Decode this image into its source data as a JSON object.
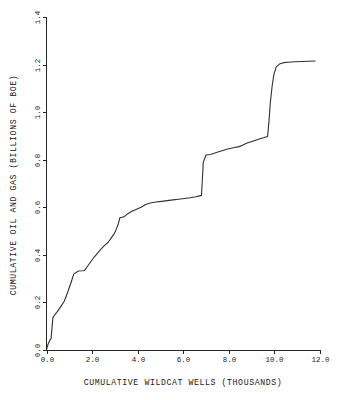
{
  "chart_data": {
    "type": "line",
    "title": "",
    "xlabel": "CUMULATIVE WILDCAT WELLS (THOUSANDS)",
    "ylabel": "CUMULATIVE OIL AND GAS (BILLIONS OF BOE)",
    "xlim": [
      0.0,
      12.0
    ],
    "ylim": [
      0.0,
      1.4
    ],
    "grid": false,
    "legend": null,
    "xticks": [
      "0.0",
      "2.0",
      "4.0",
      "6.0",
      "8.0",
      "10.0",
      "12.0"
    ],
    "xtick_values": [
      0.0,
      2.0,
      4.0,
      6.0,
      8.0,
      10.0,
      12.0
    ],
    "yticks": [
      "0.0",
      "0.2",
      "0.4",
      "0.6",
      "0.8",
      "1.0",
      "1.2",
      "1.4"
    ],
    "ytick_values": [
      0.0,
      0.2,
      0.4,
      0.6,
      0.8,
      1.0,
      1.2,
      1.4
    ],
    "series": [
      {
        "name": "cumulative discovery",
        "color": "#303030",
        "x": [
          0.0,
          0.03,
          0.06,
          0.1,
          0.14,
          0.2,
          0.28,
          0.36,
          0.45,
          0.6,
          0.78,
          0.95,
          1.08,
          1.2,
          1.4,
          1.58,
          1.66,
          1.8,
          1.95,
          2.1,
          2.25,
          2.4,
          2.55,
          2.7,
          2.82,
          2.95,
          3.05,
          3.15,
          3.22,
          3.4,
          3.55,
          3.75,
          3.95,
          4.15,
          4.35,
          4.55,
          4.8,
          5.05,
          5.3,
          5.55,
          5.8,
          6.05,
          6.3,
          6.55,
          6.72,
          6.8,
          6.84,
          6.88,
          7.0,
          7.2,
          7.45,
          7.7,
          7.95,
          8.2,
          8.45,
          8.62,
          8.8,
          9.05,
          9.3,
          9.55,
          9.7,
          9.76,
          9.82,
          9.9,
          9.98,
          10.08,
          10.22,
          10.4,
          10.6,
          10.9,
          11.2,
          11.5,
          11.78
        ],
        "y": [
          0.0,
          0.012,
          0.022,
          0.03,
          0.04,
          0.048,
          0.135,
          0.148,
          0.158,
          0.178,
          0.205,
          0.248,
          0.285,
          0.32,
          0.332,
          0.333,
          0.334,
          0.352,
          0.372,
          0.392,
          0.408,
          0.425,
          0.44,
          0.452,
          0.468,
          0.486,
          0.505,
          0.53,
          0.556,
          0.56,
          0.572,
          0.583,
          0.592,
          0.6,
          0.612,
          0.618,
          0.622,
          0.625,
          0.628,
          0.631,
          0.634,
          0.637,
          0.64,
          0.644,
          0.648,
          0.65,
          0.72,
          0.79,
          0.82,
          0.822,
          0.83,
          0.838,
          0.845,
          0.85,
          0.855,
          0.862,
          0.87,
          0.878,
          0.886,
          0.893,
          0.898,
          0.96,
          1.04,
          1.11,
          1.16,
          1.19,
          1.202,
          1.208,
          1.21,
          1.212,
          1.213,
          1.214,
          1.215
        ]
      }
    ],
    "annotations": [
      {
        "label": "step rise near 6.85",
        "x": 6.85,
        "y_from": 0.65,
        "y_to": 0.82
      },
      {
        "label": "step rise near 9.80",
        "x": 9.8,
        "y_from": 0.898,
        "y_to": 1.21
      },
      {
        "label": "plateau near 1.1-1.6",
        "x": 1.35,
        "y": 0.333
      },
      {
        "label": "terminal plateau",
        "x": 11.0,
        "y": 1.213
      }
    ]
  }
}
